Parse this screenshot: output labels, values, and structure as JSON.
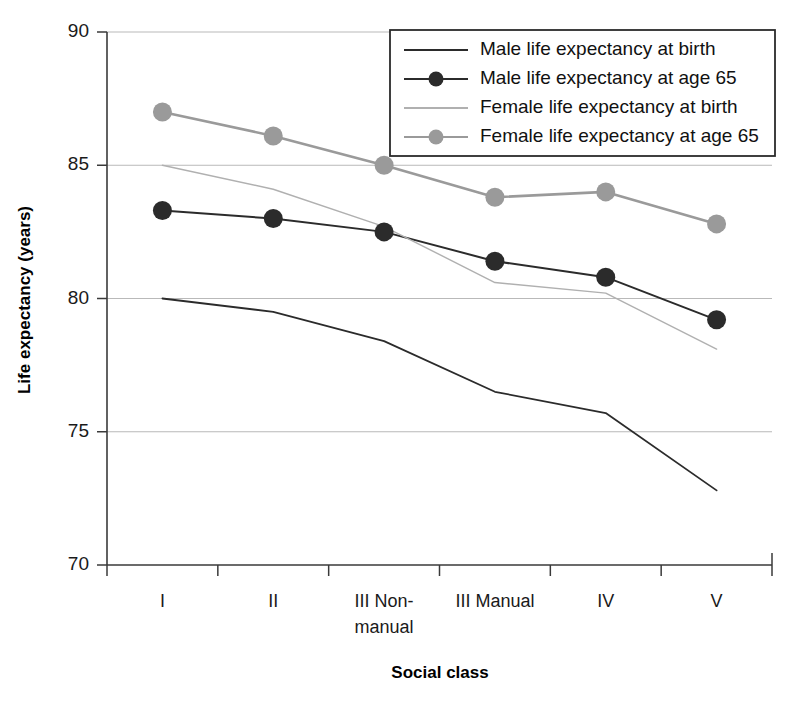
{
  "chart_data": {
    "type": "line",
    "title": "",
    "subtitle": "",
    "xlabel": "Social class",
    "ylabel": "Life expectancy (years)",
    "categories": [
      "I",
      "II",
      "III Non-manual",
      "III Manual",
      "IV",
      "V"
    ],
    "category_lines": [
      [
        "I"
      ],
      [
        "II"
      ],
      [
        "III Non-",
        "manual"
      ],
      [
        "III Manual"
      ],
      [
        "IV"
      ],
      [
        "V"
      ]
    ],
    "ylim": [
      70,
      90
    ],
    "yticks": [
      70,
      75,
      80,
      85,
      90
    ],
    "ytick_labels": [
      "70",
      "75",
      "80",
      "85",
      "90"
    ],
    "grid": "horizontal",
    "legend_position": "top-right",
    "series": [
      {
        "name": "Male life expectancy at birth",
        "values": [
          80.0,
          79.5,
          78.4,
          76.5,
          75.7,
          72.8
        ],
        "color": "#2b2b2b",
        "line_width": 1.8,
        "marker": "none"
      },
      {
        "name": "Male life expectancy at age 65",
        "values": [
          83.3,
          83.0,
          82.5,
          81.4,
          80.8,
          79.2
        ],
        "color": "#2b2b2b",
        "line_width": 2.0,
        "marker": "circle"
      },
      {
        "name": "Female life expectancy at birth",
        "values": [
          85.0,
          84.1,
          82.7,
          80.6,
          80.2,
          78.1
        ],
        "color": "#b0b0b0",
        "line_width": 1.4,
        "marker": "none"
      },
      {
        "name": "Female life expectancy at age 65",
        "values": [
          87.0,
          86.1,
          85.0,
          83.8,
          84.0,
          82.8
        ],
        "color": "#9a9a9a",
        "line_width": 2.6,
        "marker": "circle"
      }
    ]
  },
  "legend": {
    "entries": [
      {
        "label": "Male life expectancy at birth",
        "color": "#2b2b2b",
        "marker": "none"
      },
      {
        "label": "Male life expectancy at age 65",
        "color": "#2b2b2b",
        "marker": "circle"
      },
      {
        "label": "Female life expectancy at birth",
        "color": "#b0b0b0",
        "marker": "none"
      },
      {
        "label": "Female life expectancy at age 65",
        "color": "#9a9a9a",
        "marker": "circle"
      }
    ]
  },
  "axes": {
    "y_title": "Life expectancy (years)",
    "x_title": "Social class"
  }
}
